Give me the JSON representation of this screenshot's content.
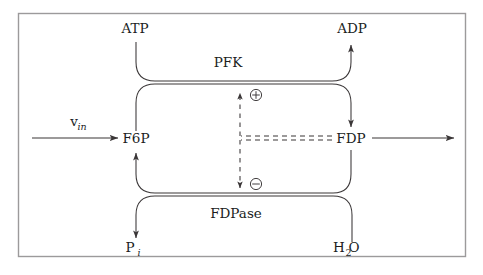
{
  "figure": {
    "name": "pfk-fdpase-futile-cycle",
    "background_color": "#ffffff",
    "frame_color": "#9c9a9b",
    "line_color": "#3a3637",
    "text_color": "#201d1d"
  },
  "labels": {
    "atp": "ATP",
    "adp": "ADP",
    "pfk": "PFK",
    "fdpase": "FDPase",
    "f6p": "F6P",
    "fdp": "FDP",
    "v_in_base": "v",
    "v_in_sub": "in",
    "pi_base": "P",
    "pi_sub": "i",
    "h2o_base": "H",
    "h2o_sub": "2",
    "h2o_tail": "O",
    "activation_sign": "+",
    "inhibition_sign": "−"
  },
  "nodes": [
    {
      "id": "atp",
      "label": "ATP",
      "x": 135,
      "y": 33,
      "role": "cosubstrate"
    },
    {
      "id": "adp",
      "label": "ADP",
      "x": 352,
      "y": 33,
      "role": "coproduct"
    },
    {
      "id": "pfk",
      "label": "PFK",
      "x": 228,
      "y": 67,
      "role": "enzyme"
    },
    {
      "id": "f6p",
      "label": "F6P",
      "x": 136,
      "y": 143,
      "role": "metabolite"
    },
    {
      "id": "fdp",
      "label": "FDP",
      "x": 351,
      "y": 143,
      "role": "metabolite"
    },
    {
      "id": "fdpase",
      "label": "FDPase",
      "x": 236,
      "y": 218,
      "role": "enzyme"
    },
    {
      "id": "pi",
      "label": "Pi",
      "x": 136,
      "y": 252,
      "role": "cosubstrate"
    },
    {
      "id": "h2o",
      "label": "H2O",
      "x": 352,
      "y": 252,
      "role": "cosubstrate"
    }
  ],
  "reactions": [
    {
      "id": "pfk-reaction",
      "enzyme": "PFK",
      "from": "F6P",
      "to": "FDP",
      "consumes": "ATP",
      "produces": "ADP",
      "direction": "left-to-right"
    },
    {
      "id": "fdpase-reaction",
      "enzyme": "FDPase",
      "from": "FDP",
      "to": "F6P",
      "consumes": "H2O",
      "produces": "Pi",
      "direction": "right-to-left"
    }
  ],
  "regulation": [
    {
      "id": "fdp-activates-pfk",
      "effector": "FDP",
      "target": "PFK",
      "sign": "+",
      "symbol": "⊕",
      "style": "dashed"
    },
    {
      "id": "fdp-inhibits-fdpase",
      "effector": "FDP",
      "target": "FDPase",
      "sign": "−",
      "symbol": "⊖",
      "style": "dashed"
    }
  ],
  "flux_arrows": [
    {
      "id": "influx",
      "label": "v_in",
      "from_x": 32,
      "to_x": 124,
      "y": 138,
      "direction": "right"
    },
    {
      "id": "outflux",
      "label": "",
      "from_x": 372,
      "to_x": 460,
      "y": 138,
      "direction": "right"
    }
  ],
  "frame": {
    "x": 18,
    "y": 13,
    "width": 448,
    "height": 244
  }
}
